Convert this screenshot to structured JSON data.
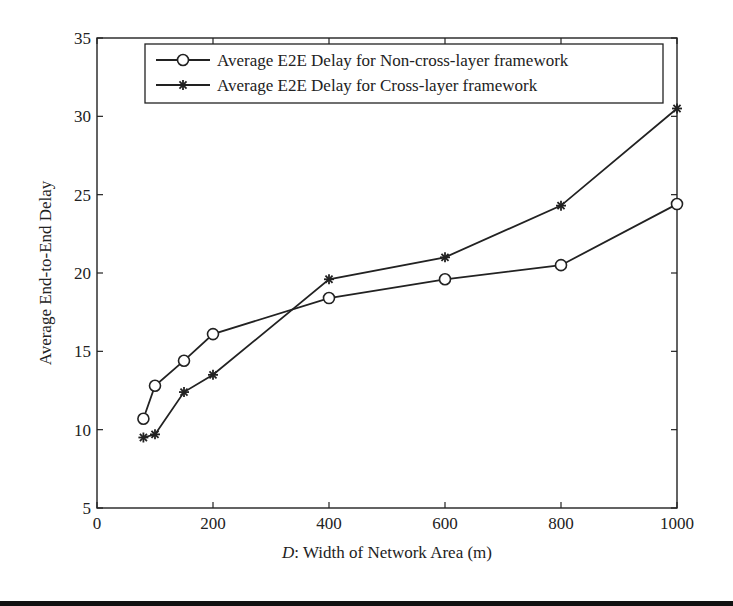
{
  "chart_data": {
    "type": "line",
    "title": "",
    "xlabel_italic": "D",
    "xlabel_rest": ": Width of Network Area (m)",
    "xlabel": "D: Width of Network Area (m)",
    "ylabel": "Average End-to-End Delay",
    "xlim": [
      0,
      1000
    ],
    "ylim": [
      5,
      35
    ],
    "xticks": [
      0,
      200,
      400,
      600,
      800,
      1000
    ],
    "yticks": [
      5,
      10,
      15,
      20,
      25,
      30,
      35
    ],
    "grid": false,
    "legend_position": "upper right (inside)",
    "x": [
      80,
      100,
      150,
      200,
      400,
      600,
      800,
      1000
    ],
    "series": [
      {
        "name": "Average E2E Delay for Non-cross-layer framework",
        "marker": "circle",
        "color": "#222222",
        "values": [
          10.7,
          12.8,
          14.4,
          16.1,
          18.4,
          19.6,
          20.5,
          24.4
        ]
      },
      {
        "name": "Average E2E Delay for Cross-layer framework",
        "marker": "star",
        "color": "#222222",
        "values": [
          9.5,
          9.7,
          12.4,
          13.5,
          19.6,
          21.0,
          24.3,
          30.5
        ]
      }
    ]
  },
  "layout": {
    "plot_left": 97,
    "plot_right": 677,
    "plot_top": 38,
    "plot_bottom": 508
  }
}
